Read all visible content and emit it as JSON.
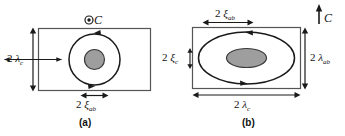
{
  "figure": {
    "title_hidden": "",
    "colors": {
      "line": "#1a1a1a",
      "core_fill": "#9e9e9e",
      "core_stroke": "#3a3a3a",
      "rect_stroke": "#555555",
      "background": "#ffffff"
    },
    "panels": [
      {
        "id": "a",
        "caption": "(a)",
        "field_symbol": "⊙",
        "field_label": "C",
        "field_direction": "out-of-plane",
        "labels": {
          "left": {
            "number": "2",
            "symbol": "λ",
            "subscript": "c",
            "full": "2 λc"
          },
          "bottom": {
            "number": "2",
            "symbol": "ξ",
            "subscript": "ab",
            "full": "2 ξab"
          }
        },
        "core_shape": "circle",
        "current_loop_shape": "circle"
      },
      {
        "id": "b",
        "caption": "(b)",
        "field_symbol": "↑",
        "field_label": "C",
        "field_direction": "in-plane-up",
        "labels": {
          "top": {
            "number": "2",
            "symbol": "ξ",
            "subscript": "ab",
            "full": "2 ξab"
          },
          "left": {
            "number": "2",
            "symbol": "ξ",
            "subscript": "c",
            "full": "2 ξc"
          },
          "right": {
            "number": "2",
            "symbol": "λ",
            "subscript": "ab",
            "full": "2 λab"
          },
          "bottom": {
            "number": "2",
            "symbol": "λ",
            "subscript": "c",
            "full": "2 λc"
          }
        },
        "core_shape": "ellipse",
        "current_loop_shape": "ellipse"
      }
    ]
  }
}
